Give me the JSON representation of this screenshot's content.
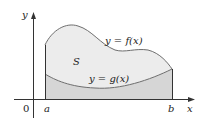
{
  "diagram": {
    "axes": {
      "x_label": "x",
      "y_label": "y",
      "origin_label": "0"
    },
    "bounds": {
      "left_label": "a",
      "right_label": "b"
    },
    "region_label": "S",
    "curves": [
      {
        "name": "upper",
        "label": "y = f(x)"
      },
      {
        "name": "lower",
        "label": "y = g(x)"
      }
    ],
    "colors": {
      "region_S_fill": "#ececec",
      "under_g_fill": "#d6d6d6",
      "curve_stroke": "#6e6e6e",
      "axis_stroke": "#333333",
      "text": "#222222"
    }
  }
}
